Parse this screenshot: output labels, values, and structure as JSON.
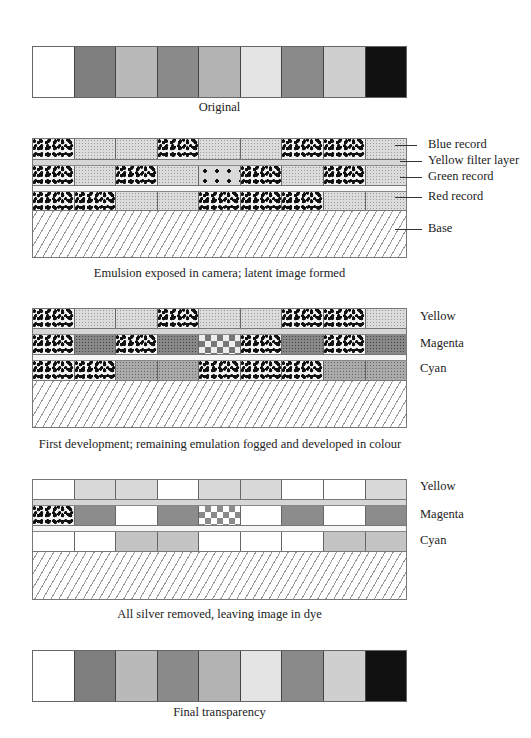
{
  "figure": {
    "panels": [
      {
        "id": "original",
        "caption": "Original",
        "swatches": [
          "#ffffff",
          "#7e7e7e",
          "#b9b9b9",
          "#8a8a8a",
          "#b3b3b3",
          "#e4e4e4",
          "#8a8a8a",
          "#cfcfcf",
          "#111111"
        ]
      },
      {
        "id": "exposure",
        "caption": "Emulsion exposed in camera; latent image formed",
        "labels": [
          "Blue record",
          "Yellow filter layer",
          "Green record",
          "Red record",
          "Base"
        ],
        "layers": {
          "blue": [
            "grain",
            "stipple",
            "stipple",
            "grain",
            "stipple",
            "stipple",
            "grain",
            "grain",
            "stipple"
          ],
          "green": [
            "grain",
            "stipple",
            "grain",
            "stipple",
            "sparse",
            "grain",
            "stipple",
            "grain",
            "stipple"
          ],
          "red": [
            "grain",
            "grain",
            "stipple",
            "stipple",
            "grain",
            "grain",
            "grain",
            "stipple",
            "stipple"
          ]
        }
      },
      {
        "id": "first-development",
        "caption": "First development; remaining emulation fogged and developed in colour",
        "labels": [
          "Yellow",
          "Magenta",
          "Cyan"
        ],
        "layers": {
          "yellow": [
            "grain",
            "stipple",
            "stipple",
            "grain",
            "stipple",
            "stipple",
            "grain",
            "grain",
            "stipple"
          ],
          "magenta": [
            "grain",
            "dark",
            "grain",
            "dark",
            "check",
            "grain",
            "dark",
            "grain",
            "dark"
          ],
          "cyan": [
            "grain",
            "grain",
            "mid",
            "mid",
            "grain",
            "grain",
            "grain",
            "mid",
            "mid"
          ]
        }
      },
      {
        "id": "silver-removed",
        "caption": "All silver removed, leaving image in dye",
        "labels": [
          "Yellow",
          "Magenta",
          "Cyan"
        ],
        "layers": {
          "yellow": [
            "white",
            "light",
            "light",
            "white",
            "light",
            "light",
            "white",
            "white",
            "light"
          ],
          "magenta": [
            "grain",
            "gray",
            "white",
            "gray",
            "check-light",
            "white",
            "gray",
            "white",
            "gray"
          ],
          "cyan": [
            "white",
            "white",
            "lmid",
            "lmid",
            "white",
            "white",
            "white",
            "lmid",
            "lmid"
          ]
        }
      },
      {
        "id": "final",
        "caption": "Final transparency",
        "swatches": [
          "#ffffff",
          "#7e7e7e",
          "#b9b9b9",
          "#8a8a8a",
          "#b3b3b3",
          "#e4e4e4",
          "#8a8a8a",
          "#cfcfcf",
          "#111111"
        ]
      }
    ]
  }
}
